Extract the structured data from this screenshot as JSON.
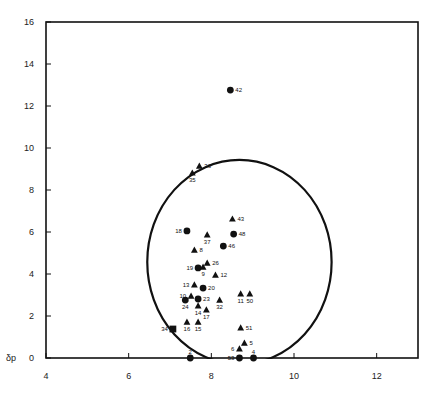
{
  "chart_data": {
    "type": "scatter",
    "title": "",
    "xlabel": "",
    "ylabel": "δp",
    "xlim": [
      4,
      13
    ],
    "ylim": [
      0,
      16
    ],
    "x_ticks": [
      4,
      6,
      8,
      10,
      12
    ],
    "y_ticks": [
      0,
      2,
      4,
      6,
      8,
      10,
      12,
      14,
      16
    ],
    "grid": false,
    "legend": null,
    "circle": {
      "cx": 8.68,
      "cy": 4.57,
      "rx": 2.23,
      "ry": 4.86
    },
    "marker_types": {
      "circle": "filled circle",
      "triangle": "filled triangle",
      "square": "filled square"
    },
    "points": [
      {
        "id": "42",
        "x": 8.46,
        "y": 12.76,
        "marker": "circle",
        "label_pos": "right"
      },
      {
        "id": "36",
        "x": 7.71,
        "y": 9.14,
        "marker": "triangle",
        "label_pos": "right"
      },
      {
        "id": "35",
        "x": 7.54,
        "y": 8.81,
        "marker": "triangle",
        "label_pos": "below"
      },
      {
        "id": "43",
        "x": 8.51,
        "y": 6.62,
        "marker": "triangle",
        "label_pos": "right"
      },
      {
        "id": "18",
        "x": 7.41,
        "y": 6.05,
        "marker": "circle",
        "label_pos": "left"
      },
      {
        "id": "37",
        "x": 7.9,
        "y": 5.86,
        "marker": "triangle",
        "label_pos": "below"
      },
      {
        "id": "48",
        "x": 8.54,
        "y": 5.9,
        "marker": "circle",
        "label_pos": "right"
      },
      {
        "id": "46",
        "x": 8.29,
        "y": 5.33,
        "marker": "circle",
        "label_pos": "right"
      },
      {
        "id": "8",
        "x": 7.59,
        "y": 5.14,
        "marker": "triangle",
        "label_pos": "right"
      },
      {
        "id": "26",
        "x": 7.9,
        "y": 4.52,
        "marker": "triangle",
        "label_pos": "right"
      },
      {
        "id": "19",
        "x": 7.68,
        "y": 4.29,
        "marker": "circle",
        "label_pos": "left"
      },
      {
        "id": "9",
        "x": 7.8,
        "y": 4.33,
        "marker": "triangle",
        "label_pos": "below"
      },
      {
        "id": "12",
        "x": 8.1,
        "y": 3.95,
        "marker": "triangle",
        "label_pos": "right"
      },
      {
        "id": "13",
        "x": 7.59,
        "y": 3.48,
        "marker": "triangle",
        "label_pos": "left"
      },
      {
        "id": "20",
        "x": 7.8,
        "y": 3.33,
        "marker": "circle",
        "label_pos": "right"
      },
      {
        "id": "10",
        "x": 7.51,
        "y": 2.95,
        "marker": "triangle",
        "label_pos": "left"
      },
      {
        "id": "11",
        "x": 8.71,
        "y": 3.05,
        "marker": "triangle",
        "label_pos": "below"
      },
      {
        "id": "50",
        "x": 8.93,
        "y": 3.05,
        "marker": "triangle",
        "label_pos": "below"
      },
      {
        "id": "24",
        "x": 7.37,
        "y": 2.76,
        "marker": "circle",
        "label_pos": "below"
      },
      {
        "id": "23",
        "x": 7.68,
        "y": 2.81,
        "marker": "circle",
        "label_pos": "right"
      },
      {
        "id": "32",
        "x": 8.2,
        "y": 2.76,
        "marker": "triangle",
        "label_pos": "below"
      },
      {
        "id": "14",
        "x": 7.68,
        "y": 2.48,
        "marker": "triangle",
        "label_pos": "below"
      },
      {
        "id": "17",
        "x": 7.88,
        "y": 2.29,
        "marker": "triangle",
        "label_pos": "below"
      },
      {
        "id": "16",
        "x": 7.41,
        "y": 1.71,
        "marker": "triangle",
        "label_pos": "below"
      },
      {
        "id": "15",
        "x": 7.68,
        "y": 1.71,
        "marker": "triangle",
        "label_pos": "below"
      },
      {
        "id": "34",
        "x": 7.07,
        "y": 1.38,
        "marker": "square",
        "label_pos": "left"
      },
      {
        "id": "51",
        "x": 8.71,
        "y": 1.43,
        "marker": "triangle",
        "label_pos": "right"
      },
      {
        "id": "5",
        "x": 8.8,
        "y": 0.71,
        "marker": "triangle",
        "label_pos": "right"
      },
      {
        "id": "6",
        "x": 8.68,
        "y": 0.43,
        "marker": "triangle",
        "label_pos": "left"
      },
      {
        "id": "2",
        "x": 7.49,
        "y": 0.0,
        "marker": "circle",
        "label_pos": "above"
      },
      {
        "id": "53",
        "x": 8.68,
        "y": 0.0,
        "marker": "circle",
        "label_pos": "left"
      },
      {
        "id": "4",
        "x": 9.02,
        "y": 0.0,
        "marker": "circle",
        "label_pos": "above"
      }
    ]
  },
  "colors": {
    "ink": "#111111",
    "axis": "#222222",
    "background": "#ffffff"
  }
}
